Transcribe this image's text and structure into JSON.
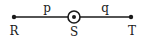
{
  "diagram": {
    "segment_labels": {
      "left": "p",
      "right": "q"
    },
    "points": {
      "left": {
        "label": "R"
      },
      "middle": {
        "label": "S",
        "marker": "circled-dot"
      },
      "right": {
        "label": "T"
      }
    },
    "colors": {
      "stroke": "#1a1a1a",
      "background": "#ffffff"
    }
  }
}
